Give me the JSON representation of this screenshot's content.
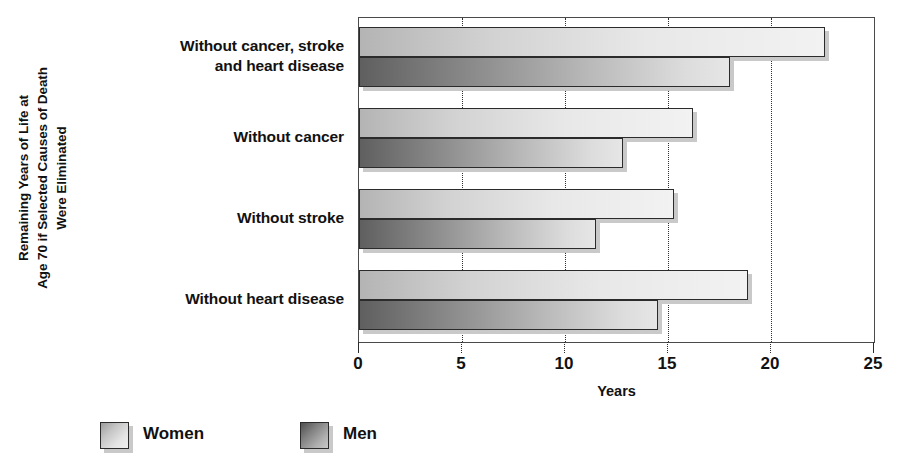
{
  "chart_data": {
    "type": "bar",
    "orientation": "horizontal",
    "title": "",
    "xlabel": "Years",
    "ylabel": "Remaining Years of Life at Age 70 if Selected Causes of Death Were Eliminated",
    "categories": [
      "Without cancer, stroke and heart disease",
      "Without cancer",
      "Without stroke",
      "Without heart disease"
    ],
    "category_lines": [
      [
        "Without cancer, stroke",
        "and heart disease"
      ],
      [
        "Without cancer"
      ],
      [
        "Without stroke"
      ],
      [
        "Without heart disease"
      ]
    ],
    "series": [
      {
        "name": "Women",
        "values": [
          22.6,
          16.2,
          15.3,
          18.9
        ],
        "color": "#e8e8e8"
      },
      {
        "name": "Men",
        "values": [
          18.0,
          12.8,
          11.5,
          14.5
        ],
        "color": "#8a8a8a"
      }
    ],
    "xlim": [
      0,
      25
    ],
    "xticks": [
      0,
      5,
      10,
      15,
      20,
      25
    ],
    "xtick_labels": [
      "0",
      "5",
      "10",
      "15",
      "20",
      "25"
    ],
    "grid": true,
    "grid_axis": "x",
    "grid_style": "dotted",
    "legend_position": "bottom-left",
    "legend_entries": [
      "Women",
      "Men"
    ]
  },
  "ylabel_lines": [
    "Remaining Years of Life at",
    "Age 70 if Selected Causes of Death",
    "Were Eliminated"
  ]
}
